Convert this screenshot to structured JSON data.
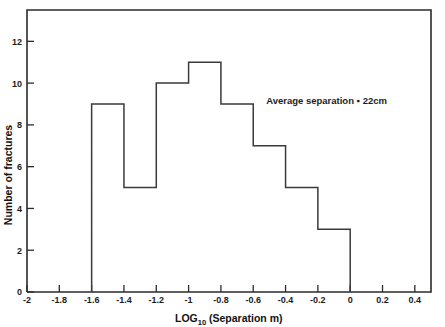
{
  "chart_data": {
    "type": "bar",
    "title": "",
    "subtitle": "",
    "xlabel_main": "LOG",
    "xlabel_sub": "10",
    "xlabel_rest": " (Separation m)",
    "xlabel_full": "LOG10 (Separation m)",
    "ylabel": "Number of fractures",
    "xlim": [
      -2,
      0.5
    ],
    "ylim": [
      0,
      13.5
    ],
    "grid": false,
    "legend": "none",
    "bin_width": 0.2,
    "bin_edges": [
      -1.6,
      -1.4,
      -1.2,
      -1.0,
      -0.8,
      -0.6,
      -0.4,
      -0.2,
      0.0
    ],
    "categories": [
      "-1.6 to -1.4",
      "-1.4 to -1.2",
      "-1.2 to -1.0",
      "-1.0 to -0.8",
      "-0.8 to -0.6",
      "-0.6 to -0.4",
      "-0.4 to -0.2",
      "-0.2 to 0"
    ],
    "values": [
      9,
      5,
      10,
      11,
      9,
      7,
      5,
      3
    ],
    "xticks": [
      -2,
      -1.8,
      -1.6,
      -1.4,
      -1.2,
      -1,
      -0.8,
      -0.6,
      -0.4,
      -0.2,
      0,
      0.2,
      0.4
    ],
    "xtick_labels": [
      "-2",
      "-1.8",
      "-1.6",
      "-1.4",
      "-1.2",
      "-1",
      "-0.8",
      "-0.6",
      "-0.4",
      "-0.2",
      "0",
      "0.2",
      "0.4"
    ],
    "yticks": [
      0,
      2,
      4,
      6,
      8,
      10,
      12
    ],
    "ytick_labels": [
      "0",
      "2",
      "4",
      "6",
      "8",
      "10",
      "12"
    ],
    "annotations": [
      {
        "text": "Average separation ▪ 22cm",
        "x": -0.52,
        "y": 9.0
      }
    ],
    "colors": {
      "background": "#ffffff",
      "axis": "#2b2b2b",
      "bar_stroke": "#3a3a3a",
      "text": "#1c1c1c"
    }
  }
}
